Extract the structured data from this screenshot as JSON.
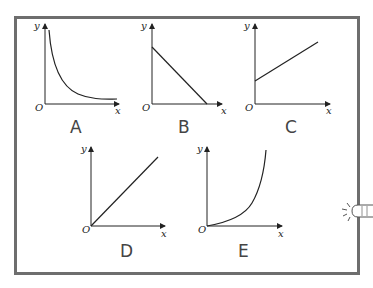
{
  "figure": {
    "axis_labels": {
      "x": "x",
      "y": "y",
      "origin": "O"
    },
    "graphs": [
      {
        "label": "A",
        "shape": "decreasing curve (inverse proportion, y = k/x)"
      },
      {
        "label": "B",
        "shape": "straight line decreasing from y-intercept to x-axis"
      },
      {
        "label": "C",
        "shape": "straight line increasing with positive y-intercept"
      },
      {
        "label": "D",
        "shape": "straight line through origin (direct proportion)"
      },
      {
        "label": "E",
        "shape": "increasing curve through origin, concave up"
      }
    ]
  },
  "decoration": {
    "icon": "pointing-hand-icon"
  },
  "colors": {
    "frame": "#6e6e6e",
    "lines": "#222222",
    "letters": "#444444"
  }
}
